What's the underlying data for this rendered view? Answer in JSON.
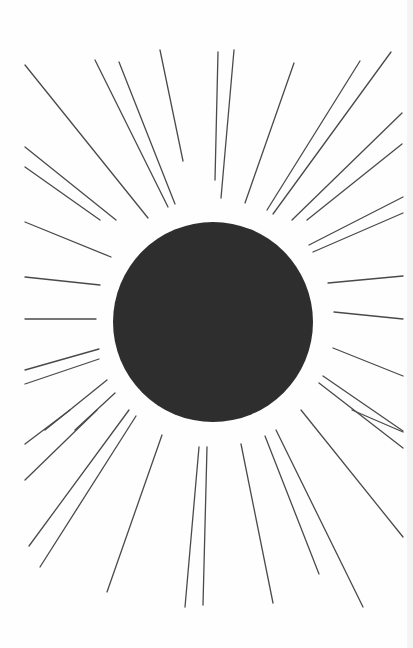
{
  "illustration": {
    "subject": "sun-with-rays",
    "colors": {
      "background": "#fefefe",
      "sun": "#2e2e2e",
      "ray": "#4a4a4a"
    },
    "sun": {
      "cx": 213,
      "cy": 322,
      "r": 100
    },
    "rays": [
      [
        25,
        65,
        148,
        218
      ],
      [
        95,
        60,
        168,
        207
      ],
      [
        119,
        62,
        175,
        204
      ],
      [
        160,
        50,
        183,
        161
      ],
      [
        218,
        52,
        215,
        180
      ],
      [
        234,
        50,
        221,
        198
      ],
      [
        294,
        63,
        245,
        203
      ],
      [
        360,
        61,
        267,
        210
      ],
      [
        391,
        52,
        273,
        214
      ],
      [
        402,
        113,
        292,
        220
      ],
      [
        402,
        144,
        307,
        220
      ],
      [
        25,
        147,
        116,
        220
      ],
      [
        25,
        167,
        100,
        220
      ],
      [
        25,
        222,
        111,
        257
      ],
      [
        25,
        277,
        100,
        285
      ],
      [
        25,
        319,
        96,
        319
      ],
      [
        25,
        370,
        99,
        349
      ],
      [
        25,
        384,
        99,
        359
      ],
      [
        403,
        197,
        309,
        245
      ],
      [
        403,
        213,
        313,
        252
      ],
      [
        403,
        276,
        328,
        283
      ],
      [
        403,
        319,
        334,
        312
      ],
      [
        403,
        376,
        333,
        348
      ],
      [
        403,
        431,
        323,
        376
      ],
      [
        403,
        448,
        319,
        383
      ],
      [
        45,
        430,
        107,
        380
      ],
      [
        75,
        430,
        115,
        393
      ],
      [
        25,
        444,
        70,
        410
      ],
      [
        25,
        480,
        97,
        410
      ],
      [
        29,
        546,
        129,
        410
      ],
      [
        40,
        567,
        136,
        416
      ],
      [
        107,
        592,
        162,
        435
      ],
      [
        185,
        607,
        199,
        447
      ],
      [
        203,
        605,
        207,
        447
      ],
      [
        273,
        603,
        241,
        444
      ],
      [
        319,
        574,
        265,
        436
      ],
      [
        363,
        607,
        276,
        430
      ],
      [
        403,
        537,
        301,
        410
      ],
      [
        403,
        432,
        352,
        410
      ]
    ]
  }
}
